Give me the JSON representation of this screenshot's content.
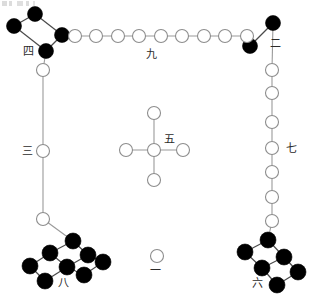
{
  "figure": {
    "width": 309,
    "height": 305,
    "background_color": "#ffffff",
    "open_node_color": "#ffffff",
    "open_node_stroke": "#8d8d8d",
    "filled_node_color": "#000000",
    "edge_color": "#9a9a9a",
    "label_color": "#2b2b2b"
  },
  "labels": {
    "one": "一",
    "two": "二",
    "three": "三",
    "four": "四",
    "five": "五",
    "six": "六",
    "seven": "七",
    "eight": "八",
    "nine": "九"
  },
  "groups": [
    {
      "id": "group-one",
      "numeral": "一",
      "count": 1,
      "node_style": "open",
      "shape": "single",
      "label_position": {
        "x": 150,
        "y": 265
      },
      "nodes": [
        {
          "cx": 157,
          "cy": 256,
          "r": 6.5
        }
      ],
      "edges": []
    },
    {
      "id": "group-two",
      "numeral": "二",
      "count": 2,
      "node_style": "filled",
      "shape": "diagonal-pair",
      "label_position": {
        "x": 270,
        "y": 38
      },
      "nodes": [
        {
          "cx": 273,
          "cy": 23,
          "r": 7.5
        },
        {
          "cx": 250,
          "cy": 46,
          "r": 7.5
        }
      ],
      "edges": [
        {
          "x1": 273,
          "y1": 23,
          "x2": 250,
          "y2": 46
        }
      ]
    },
    {
      "id": "group-three",
      "numeral": "三",
      "count": 3,
      "node_style": "open",
      "shape": "vertical-chain",
      "label_position": {
        "x": 22,
        "y": 146
      },
      "nodes": [
        {
          "cx": 43,
          "cy": 70,
          "r": 6.5
        },
        {
          "cx": 43,
          "cy": 151,
          "r": 6.5
        },
        {
          "cx": 43,
          "cy": 219,
          "r": 6.5
        }
      ],
      "edges": [
        {
          "x1": 43,
          "y1": 70,
          "x2": 43,
          "y2": 151
        },
        {
          "x1": 43,
          "y1": 151,
          "x2": 43,
          "y2": 219
        }
      ]
    },
    {
      "id": "group-four",
      "numeral": "四",
      "count": 4,
      "node_style": "filled",
      "shape": "parallelogram-chain",
      "label_position": {
        "x": 23,
        "y": 46
      },
      "nodes": [
        {
          "cx": 35,
          "cy": 14,
          "r": 7.5
        },
        {
          "cx": 14,
          "cy": 26,
          "r": 7.5
        },
        {
          "cx": 62,
          "cy": 35,
          "r": 7.5
        },
        {
          "cx": 46,
          "cy": 51,
          "r": 7.5
        }
      ],
      "edges": [
        {
          "x1": 35,
          "y1": 14,
          "x2": 14,
          "y2": 26
        },
        {
          "x1": 35,
          "y1": 14,
          "x2": 62,
          "y2": 35
        },
        {
          "x1": 14,
          "y1": 26,
          "x2": 46,
          "y2": 51
        },
        {
          "x1": 62,
          "y1": 35,
          "x2": 46,
          "y2": 51
        }
      ]
    },
    {
      "id": "group-five",
      "numeral": "五",
      "count": 5,
      "node_style": "open",
      "shape": "cross",
      "label_position": {
        "x": 164,
        "y": 134
      },
      "nodes": [
        {
          "cx": 154,
          "cy": 113,
          "r": 6.5
        },
        {
          "cx": 126,
          "cy": 150,
          "r": 6.5
        },
        {
          "cx": 154,
          "cy": 150,
          "r": 6.5
        },
        {
          "cx": 183,
          "cy": 150,
          "r": 6.5
        },
        {
          "cx": 154,
          "cy": 180,
          "r": 6.5
        }
      ],
      "edges": [
        {
          "x1": 154,
          "y1": 113,
          "x2": 154,
          "y2": 150
        },
        {
          "x1": 126,
          "y1": 150,
          "x2": 183,
          "y2": 150
        },
        {
          "x1": 154,
          "y1": 150,
          "x2": 154,
          "y2": 180
        }
      ]
    },
    {
      "id": "group-six",
      "numeral": "六",
      "count": 6,
      "node_style": "filled",
      "shape": "double-diagonal-3",
      "label_position": {
        "x": 252,
        "y": 278
      },
      "nodes": [
        {
          "cx": 268,
          "cy": 240,
          "r": 8.0
        },
        {
          "cx": 245,
          "cy": 252,
          "r": 8.0
        },
        {
          "cx": 284,
          "cy": 257,
          "r": 8.0
        },
        {
          "cx": 262,
          "cy": 268,
          "r": 8.0
        },
        {
          "cx": 298,
          "cy": 272,
          "r": 8.0
        },
        {
          "cx": 277,
          "cy": 285,
          "r": 8.0
        }
      ],
      "edges": [
        {
          "x1": 268,
          "y1": 240,
          "x2": 245,
          "y2": 252
        },
        {
          "x1": 268,
          "y1": 240,
          "x2": 284,
          "y2": 257
        },
        {
          "x1": 245,
          "y1": 252,
          "x2": 262,
          "y2": 268
        },
        {
          "x1": 284,
          "y1": 257,
          "x2": 262,
          "y2": 268
        },
        {
          "x1": 284,
          "y1": 257,
          "x2": 298,
          "y2": 272
        },
        {
          "x1": 262,
          "y1": 268,
          "x2": 277,
          "y2": 285
        },
        {
          "x1": 298,
          "y1": 272,
          "x2": 277,
          "y2": 285
        }
      ]
    },
    {
      "id": "group-seven",
      "numeral": "七",
      "count": 7,
      "node_style": "open",
      "shape": "vertical-chain",
      "label_position": {
        "x": 286,
        "y": 143
      },
      "nodes": [
        {
          "cx": 272,
          "cy": 70,
          "r": 6.5
        },
        {
          "cx": 272,
          "cy": 93,
          "r": 6.5
        },
        {
          "cx": 272,
          "cy": 122,
          "r": 6.5
        },
        {
          "cx": 272,
          "cy": 148,
          "r": 6.5
        },
        {
          "cx": 272,
          "cy": 172,
          "r": 6.5
        },
        {
          "cx": 272,
          "cy": 197,
          "r": 6.5
        },
        {
          "cx": 272,
          "cy": 221,
          "r": 6.5
        }
      ],
      "edges": [
        {
          "x1": 272,
          "y1": 70,
          "x2": 272,
          "y2": 221
        }
      ]
    },
    {
      "id": "group-eight",
      "numeral": "八",
      "count": 8,
      "node_style": "filled",
      "shape": "double-diagonal-4",
      "label_position": {
        "x": 58,
        "y": 278
      },
      "nodes": [
        {
          "cx": 73,
          "cy": 241,
          "r": 8.0
        },
        {
          "cx": 50,
          "cy": 253,
          "r": 8.0
        },
        {
          "cx": 30,
          "cy": 266,
          "r": 8.0
        },
        {
          "cx": 88,
          "cy": 255,
          "r": 8.0
        },
        {
          "cx": 67,
          "cy": 267,
          "r": 8.0
        },
        {
          "cx": 45,
          "cy": 281,
          "r": 8.0
        },
        {
          "cx": 84,
          "cy": 275,
          "r": 8.0
        },
        {
          "cx": 103,
          "cy": 262,
          "r": 8.0
        }
      ],
      "edges": [
        {
          "x1": 73,
          "y1": 241,
          "x2": 50,
          "y2": 253
        },
        {
          "x1": 50,
          "y1": 253,
          "x2": 30,
          "y2": 266
        },
        {
          "x1": 73,
          "y1": 241,
          "x2": 88,
          "y2": 255
        },
        {
          "x1": 88,
          "y1": 255,
          "x2": 103,
          "y2": 262
        },
        {
          "x1": 50,
          "y1": 253,
          "x2": 67,
          "y2": 267
        },
        {
          "x1": 30,
          "y1": 266,
          "x2": 45,
          "y2": 281
        },
        {
          "x1": 67,
          "y1": 267,
          "x2": 88,
          "y2": 255
        },
        {
          "x1": 67,
          "y1": 267,
          "x2": 84,
          "y2": 275
        },
        {
          "x1": 45,
          "y1": 281,
          "x2": 67,
          "y2": 267
        },
        {
          "x1": 84,
          "y1": 275,
          "x2": 103,
          "y2": 262
        }
      ]
    },
    {
      "id": "group-nine",
      "numeral": "九",
      "count": 9,
      "node_style": "open",
      "shape": "horizontal-row",
      "label_position": {
        "x": 146,
        "y": 49
      },
      "nodes": [
        {
          "cx": 75,
          "cy": 36,
          "r": 6.5
        },
        {
          "cx": 96,
          "cy": 36,
          "r": 6.5
        },
        {
          "cx": 118,
          "cy": 36,
          "r": 6.5
        },
        {
          "cx": 139,
          "cy": 36,
          "r": 6.5
        },
        {
          "cx": 161,
          "cy": 36,
          "r": 6.5
        },
        {
          "cx": 182,
          "cy": 36,
          "r": 6.5
        },
        {
          "cx": 204,
          "cy": 36,
          "r": 6.5
        },
        {
          "cx": 225,
          "cy": 36,
          "r": 6.5
        },
        {
          "cx": 247,
          "cy": 36,
          "r": 6.5
        }
      ],
      "edges": [
        {
          "x1": 75,
          "y1": 36,
          "x2": 247,
          "y2": 36
        }
      ]
    }
  ],
  "connectors": [
    {
      "id": "four-to-nine",
      "x1": 62,
      "y1": 35,
      "x2": 75,
      "y2": 36
    },
    {
      "id": "four-to-three",
      "x1": 46,
      "y1": 51,
      "x2": 43,
      "y2": 70
    },
    {
      "id": "nine-to-two",
      "x1": 247,
      "y1": 36,
      "x2": 250,
      "y2": 46
    },
    {
      "id": "two-to-seven",
      "x1": 273,
      "y1": 23,
      "x2": 272,
      "y2": 70
    },
    {
      "id": "three-to-eight",
      "x1": 43,
      "y1": 219,
      "x2": 73,
      "y2": 241
    },
    {
      "id": "seven-to-six",
      "x1": 272,
      "y1": 221,
      "x2": 268,
      "y2": 240
    }
  ]
}
